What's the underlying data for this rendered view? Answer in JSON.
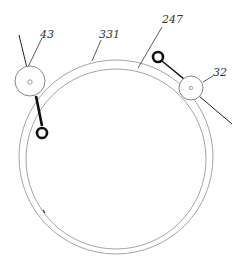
{
  "diagram": {
    "labels": {
      "l43": "43",
      "l331": "331",
      "l247": "247",
      "l32": "32"
    },
    "colors": {
      "ring": "#9a9a9a",
      "arm": "#111111",
      "line": "#222222",
      "label": "#333333"
    }
  }
}
